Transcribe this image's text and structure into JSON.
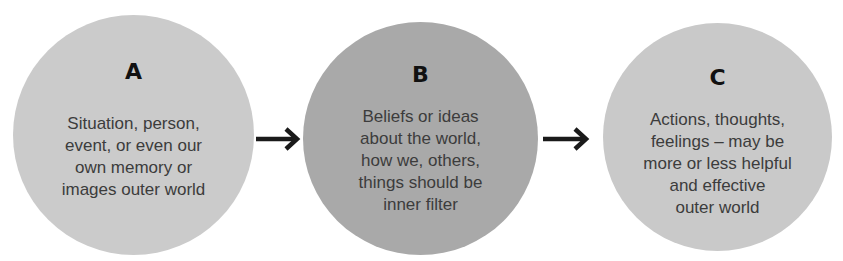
{
  "diagram": {
    "type": "ABC model flow",
    "colors": {
      "circle_a": "#cbcbcb",
      "circle_b": "#a9a9a9",
      "circle_c": "#c9c9c9",
      "arrow": "#1a1a1a",
      "letter": "#111111",
      "text": "#3c3c3c"
    },
    "nodes": [
      {
        "letter": "A",
        "text": "Situation, person,\nevent,  or even our\nown memory  or\nimages outer world"
      },
      {
        "letter": "B",
        "text": "Beliefs or ideas\nabout the world,\nhow we, others,\nthings should be\ninner filter"
      },
      {
        "letter": "C",
        "text": "Actions, thoughts,\nfeelings – may be\nmore or less helpful\nand effective\nouter world"
      }
    ],
    "edges": [
      {
        "from": "A",
        "to": "B",
        "icon": "arrow-right-icon"
      },
      {
        "from": "B",
        "to": "C",
        "icon": "arrow-right-icon"
      }
    ]
  }
}
